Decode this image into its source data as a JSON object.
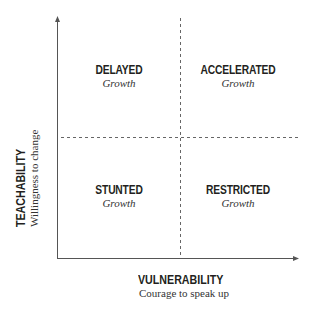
{
  "quadrants": {
    "top_left": {
      "title": "DELAYED",
      "subtitle": "Growth"
    },
    "top_right": {
      "title": "ACCELERATED",
      "subtitle": "Growth"
    },
    "bottom_left": {
      "title": "STUNTED",
      "subtitle": "Growth"
    },
    "bottom_right": {
      "title": "RESTRICTED",
      "subtitle": "Growth"
    }
  },
  "x_axis": {
    "title": "VULNERABILITY",
    "subtitle": "Courage to speak up"
  },
  "y_axis": {
    "title": "TEACHABILITY",
    "subtitle": "Willingness to change"
  },
  "colors": {
    "axis": "#555555",
    "dash": "#666666",
    "text": "#231f20"
  }
}
